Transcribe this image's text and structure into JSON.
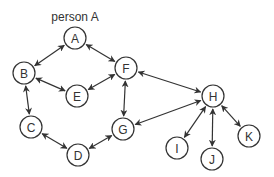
{
  "caption": "person A",
  "colors": {
    "stroke": "#333333",
    "background": "#ffffff"
  },
  "nodes": [
    {
      "id": "A",
      "label": "A",
      "x": 75,
      "y": 38
    },
    {
      "id": "B",
      "label": "B",
      "x": 24,
      "y": 73
    },
    {
      "id": "C",
      "label": "C",
      "x": 31,
      "y": 127
    },
    {
      "id": "D",
      "label": "D",
      "x": 78,
      "y": 155
    },
    {
      "id": "E",
      "label": "E",
      "x": 77,
      "y": 96
    },
    {
      "id": "F",
      "label": "F",
      "x": 126,
      "y": 68
    },
    {
      "id": "G",
      "label": "G",
      "x": 123,
      "y": 129
    },
    {
      "id": "H",
      "label": "H",
      "x": 213,
      "y": 96
    },
    {
      "id": "I",
      "label": "I",
      "x": 177,
      "y": 148
    },
    {
      "id": "J",
      "label": "J",
      "x": 212,
      "y": 159
    },
    {
      "id": "K",
      "label": "K",
      "x": 249,
      "y": 136
    }
  ],
  "edges": [
    {
      "from": "A",
      "to": "B",
      "bidirectional": true
    },
    {
      "from": "A",
      "to": "F",
      "bidirectional": true
    },
    {
      "from": "B",
      "to": "E",
      "bidirectional": true
    },
    {
      "from": "E",
      "to": "F",
      "bidirectional": true
    },
    {
      "from": "B",
      "to": "C",
      "bidirectional": true
    },
    {
      "from": "F",
      "to": "G",
      "bidirectional": true
    },
    {
      "from": "C",
      "to": "D",
      "bidirectional": true
    },
    {
      "from": "D",
      "to": "G",
      "bidirectional": true
    },
    {
      "from": "F",
      "to": "H",
      "bidirectional": true
    },
    {
      "from": "G",
      "to": "H",
      "bidirectional": true
    },
    {
      "from": "H",
      "to": "I",
      "bidirectional": true
    },
    {
      "from": "H",
      "to": "J",
      "bidirectional": true
    },
    {
      "from": "H",
      "to": "K",
      "bidirectional": true
    }
  ]
}
